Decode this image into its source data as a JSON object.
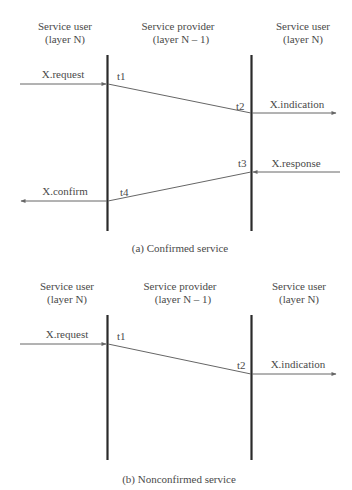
{
  "diagrams": [
    {
      "caption": "(a) Confirmed service",
      "columns": [
        {
          "line1": "Service user",
          "line2": "(layer N)"
        },
        {
          "line1": "Service provider",
          "line2": "(layer N – 1)"
        },
        {
          "line1": "Service user",
          "line2": "(layer N)"
        }
      ],
      "primitives": {
        "request": "X.request",
        "indication": "X.indication",
        "response": "X.response",
        "confirm": "X.confirm"
      },
      "times": {
        "t1": "t1",
        "t2": "t2",
        "t3": "t3",
        "t4": "t4"
      }
    },
    {
      "caption": "(b) Nonconfirmed service",
      "columns": [
        {
          "line1": "Service user",
          "line2": "(layer N)"
        },
        {
          "line1": "Service provider",
          "line2": "(layer N – 1)"
        },
        {
          "line1": "Service user",
          "line2": "(layer N)"
        }
      ],
      "primitives": {
        "request": "X.request",
        "indication": "X.indication"
      },
      "times": {
        "t1": "t1",
        "t2": "t2"
      }
    }
  ],
  "colors": {
    "lifeline": "#2a2a2a",
    "arrow": "#666666",
    "text": "#4a4a4a"
  }
}
